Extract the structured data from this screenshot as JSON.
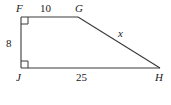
{
  "figure": {
    "type": "right-trapezoid-geometry-diagram",
    "background_color": "#ffffff",
    "stroke_color": "#3a3a3a",
    "text_color": "#1a1a1a",
    "vertices": [
      {
        "name": "F",
        "label": "F",
        "x": 21,
        "y": 17,
        "right_angle": true
      },
      {
        "name": "G",
        "label": "G",
        "x": 78,
        "y": 17,
        "right_angle": false
      },
      {
        "name": "H",
        "label": "H",
        "x": 160,
        "y": 68,
        "right_angle": false
      },
      {
        "name": "J",
        "label": "J",
        "x": 21,
        "y": 68,
        "right_angle": true
      }
    ],
    "sides": [
      {
        "name": "FG",
        "label": "10",
        "position": "top",
        "from": "F",
        "to": "G"
      },
      {
        "name": "FJ",
        "label": "8",
        "position": "left",
        "from": "F",
        "to": "J"
      },
      {
        "name": "JH",
        "label": "25",
        "position": "bottom",
        "from": "J",
        "to": "H"
      },
      {
        "name": "GH",
        "label": "x",
        "position": "hypotenuse",
        "from": "G",
        "to": "H",
        "unknown": true
      }
    ],
    "right_angle_markers": [
      {
        "at": "F",
        "size": 7
      },
      {
        "at": "J",
        "size": 7
      }
    ]
  }
}
